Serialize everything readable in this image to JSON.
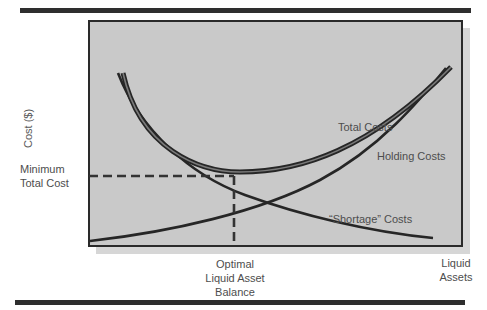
{
  "diagram": {
    "y_axis_label": "Cost ($)",
    "x_axis_label_line1": "Liquid",
    "x_axis_label_line2": "Assets",
    "min_total_cost_line1": "Minimum",
    "min_total_cost_line2": "Total Cost",
    "optimal_line1": "Optimal",
    "optimal_line2": "Liquid Asset",
    "optimal_line3": "Balance",
    "curves": {
      "total": "Total Costs",
      "holding": "Holding Costs",
      "shortage": "“Shortage” Costs"
    },
    "colors": {
      "plot_background": "#c9c9c9",
      "shadow": "#d6d6d6",
      "line": "#2a2a2a",
      "rule": "#2e2e2e",
      "text": "#4d4d4d"
    }
  }
}
